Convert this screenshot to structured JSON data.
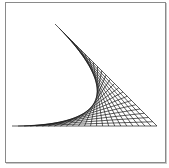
{
  "figure": {
    "type": "string-art-envelope",
    "line_color": "#1a1a1a",
    "border_color": "#8a8a8a",
    "segment_a": {
      "start": [
        55,
        24
      ],
      "end": [
        157,
        126
      ]
    },
    "segment_b": {
      "start": [
        157,
        126
      ],
      "end": [
        12,
        126
      ]
    },
    "divisions": 24
  }
}
